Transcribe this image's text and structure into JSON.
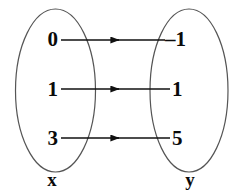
{
  "diagram": {
    "type": "mapping-diagram",
    "stroke_color": "#555555",
    "text_color": "#0a0a0a",
    "background": "#ffffff",
    "domain": {
      "label": "x",
      "values": [
        "0",
        "1",
        "3"
      ]
    },
    "range": {
      "label": "y",
      "values": [
        "–1",
        "1",
        "5"
      ]
    },
    "mappings": [
      {
        "from": "0",
        "to": "–1"
      },
      {
        "from": "1",
        "to": "1"
      },
      {
        "from": "3",
        "to": "5"
      }
    ],
    "arrow_head": "solid-triangle",
    "arrow_count": 3
  }
}
